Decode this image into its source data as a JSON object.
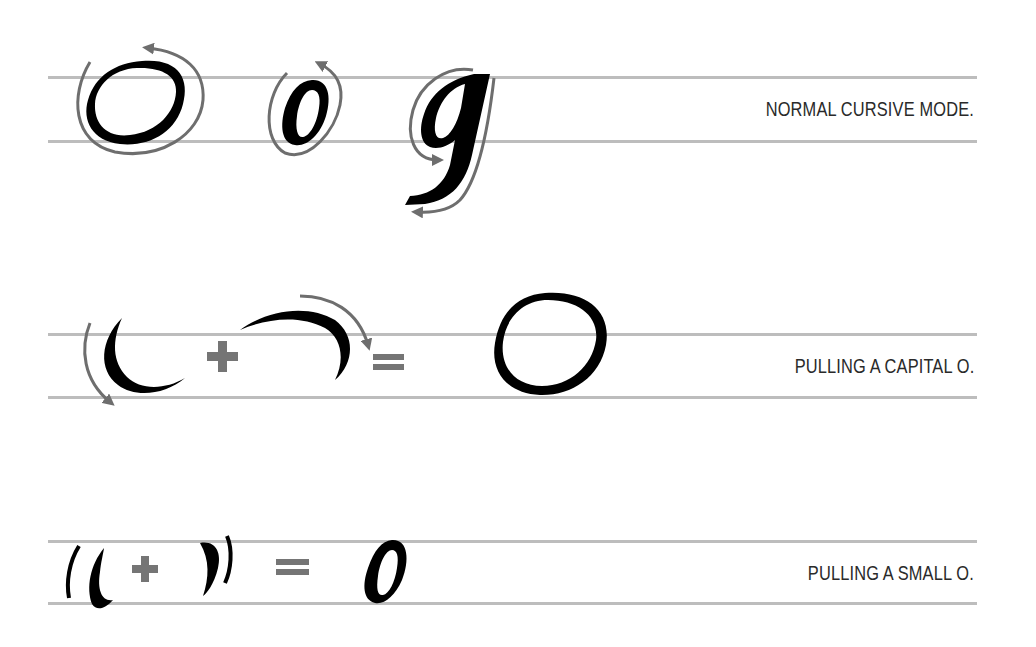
{
  "rows": [
    {
      "label": "NORMAL CURSIVE MODE.",
      "glyphs": [
        "O",
        "o",
        "g"
      ]
    },
    {
      "label": "PULLING A CAPITAL O.",
      "equation": [
        "left-stroke",
        "+",
        "right-stroke",
        "=",
        "O"
      ]
    },
    {
      "label": "PULLING A SMALL O.",
      "equation": [
        "left-stroke",
        "+",
        "right-stroke",
        "=",
        "o"
      ]
    }
  ],
  "colors": {
    "ink": "#000000",
    "arrow": "#6e6e6e",
    "guide": "#bdbdbd",
    "operator": "#757575",
    "label": "#2a2a2a"
  }
}
